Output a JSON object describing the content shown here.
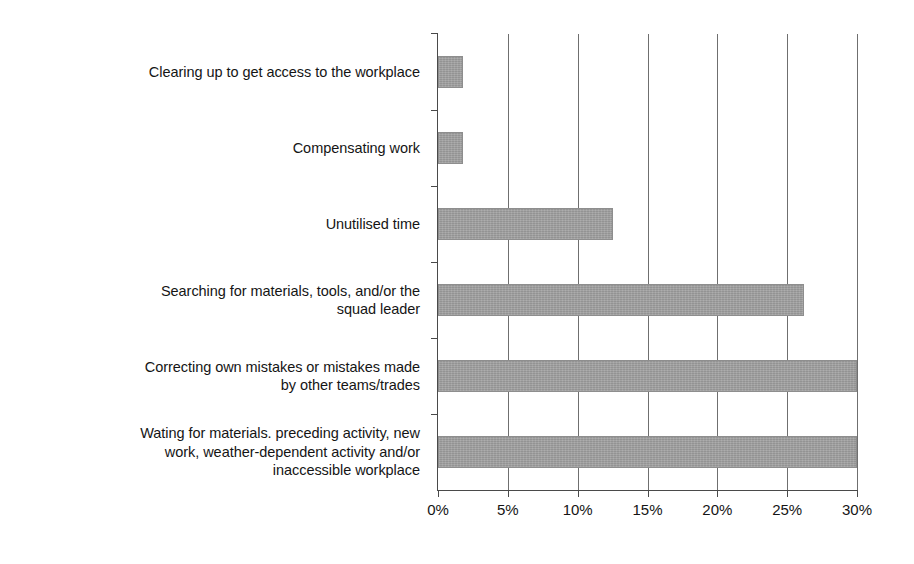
{
  "chart_data": {
    "type": "bar",
    "orientation": "horizontal",
    "title": "",
    "subtitle": "",
    "xlabel": "",
    "ylabel": "",
    "categories": [
      "Clearing up to get access to the workplace",
      "Compensating work",
      "Unutilised time",
      "Searching for materials, tools, and/or the\nsquad leader",
      "Correcting own mistakes or mistakes made\nby other teams/trades",
      "Wating for materials. preceding activity, new\nwork, weather-dependent activity and/or\ninaccessible workplace"
    ],
    "values": [
      1.8,
      1.8,
      12.5,
      26.2,
      30.0,
      30.0
    ],
    "value_unit": "%",
    "xlim": [
      0,
      30
    ],
    "xticks": [
      0,
      5,
      10,
      15,
      20,
      25,
      30
    ],
    "xtick_labels": [
      "0%",
      "5%",
      "10%",
      "15%",
      "20%",
      "25%",
      "30%"
    ],
    "grid": "vertical",
    "legend": "none",
    "bar_color": "#9d9d9d",
    "axis_color": "#4a4a4a",
    "background": "#ffffff"
  }
}
